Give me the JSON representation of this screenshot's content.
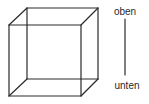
{
  "figure": {
    "type": "necker-cube",
    "colors": {
      "stroke": "#2a2a2a",
      "background": "#ffffff"
    },
    "cube": {
      "back_square": {
        "tl": [
          27,
          8
        ],
        "tr": [
          98,
          8
        ],
        "br": [
          98,
          79
        ],
        "bl": [
          27,
          79
        ]
      },
      "front_square": {
        "tl": [
          9,
          25
        ],
        "tr": [
          81,
          25
        ],
        "br": [
          81,
          96
        ],
        "bl": [
          9,
          96
        ]
      }
    },
    "axis": {
      "top_label": "oben",
      "bottom_label": "unten",
      "line": {
        "x": 125,
        "y1": 19,
        "y2": 75
      }
    }
  }
}
